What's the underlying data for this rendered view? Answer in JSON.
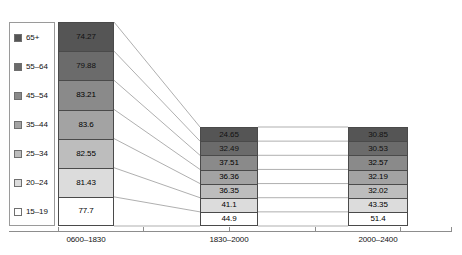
{
  "chart_data": {
    "type": "bar",
    "title": "",
    "subtitle": "",
    "xlabel": "",
    "ylabel": "",
    "grid": false,
    "legend_position": "left",
    "stacked_style": "segmented-bands-with-connectors",
    "categories": [
      "0600–1830",
      "1830–2000",
      "2000–2400"
    ],
    "series": [
      {
        "name": "65+",
        "swatch": "#555555",
        "values": [
          74.27,
          24.65,
          30.85
        ]
      },
      {
        "name": "55–64",
        "swatch": "#6b6b6b",
        "values": [
          79.88,
          32.49,
          30.53
        ]
      },
      {
        "name": "45–54",
        "swatch": "#8a8a8a",
        "values": [
          83.21,
          37.51,
          32.57
        ]
      },
      {
        "name": "35–44",
        "swatch": "#a3a3a3",
        "values": [
          83.6,
          36.36,
          32.19
        ]
      },
      {
        "name": "25–34",
        "swatch": "#bdbdbd",
        "values": [
          82.55,
          36.35,
          32.02
        ]
      },
      {
        "name": "20–24",
        "swatch": "#dcdcdc",
        "values": [
          81.43,
          41.1,
          43.35
        ]
      },
      {
        "name": "15–19",
        "swatch": "#ffffff",
        "values": [
          77.7,
          44.9,
          51.4
        ]
      }
    ]
  },
  "legend": {
    "items": [
      {
        "label": "65+",
        "color": "#555555"
      },
      {
        "label": "55–64",
        "color": "#6b6b6b"
      },
      {
        "label": "45–54",
        "color": "#8a8a8a"
      },
      {
        "label": "35–44",
        "color": "#a3a3a3"
      },
      {
        "label": "25–34",
        "color": "#bdbdbd"
      },
      {
        "label": "20–24",
        "color": "#dcdcdc"
      },
      {
        "label": "15–19",
        "color": "#ffffff"
      }
    ]
  },
  "bars": [
    {
      "category": "0600–1830",
      "values": [
        "74.27",
        "79.88",
        "83.21",
        "83.6",
        "82.55",
        "81.43",
        "77.7"
      ]
    },
    {
      "category": "1830–2000",
      "values": [
        "24.65",
        "32.49",
        "37.51",
        "36.36",
        "36.35",
        "41.1",
        "44.9"
      ]
    },
    {
      "category": "2000–2400",
      "values": [
        "30.85",
        "30.53",
        "32.57",
        "32.19",
        "32.02",
        "43.35",
        "51.4"
      ]
    }
  ],
  "axis": {
    "labels": [
      "0600–1830",
      "1830–2000",
      "2000–2400"
    ]
  },
  "colors": {
    "axis": "#8d8d8d",
    "border": "#4a4a4a",
    "connector": "#8d8d8d",
    "text": "#111111"
  }
}
